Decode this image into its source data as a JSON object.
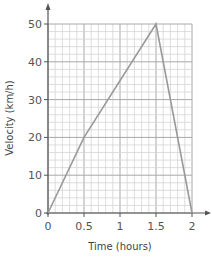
{
  "chart_data": {
    "type": "line",
    "title": "",
    "xlabel": "Time (hours)",
    "ylabel": "Velocity (km/h)",
    "xlim": [
      0,
      2
    ],
    "ylim": [
      0,
      50
    ],
    "x_ticks": [
      0,
      0.5,
      1,
      1.5,
      2
    ],
    "x_tick_labels": [
      "0",
      "0.5",
      "1",
      "1.5",
      "2"
    ],
    "y_ticks": [
      0,
      10,
      20,
      30,
      40,
      50
    ],
    "y_tick_labels": [
      "0",
      "10",
      "20",
      "30",
      "40",
      "50"
    ],
    "x_minor_step": 0.1,
    "y_minor_step": 2,
    "grid": true,
    "legend": null,
    "series": [
      {
        "name": "Velocity",
        "x": [
          0,
          0.5,
          1.5,
          2
        ],
        "y": [
          0,
          20,
          50,
          0
        ]
      }
    ]
  },
  "colors": {
    "line": "#9a9a9a",
    "grid_minor": "#d4d4d4",
    "grid_major": "#a8a8a8",
    "axis": "#555555",
    "text": "#555555"
  }
}
